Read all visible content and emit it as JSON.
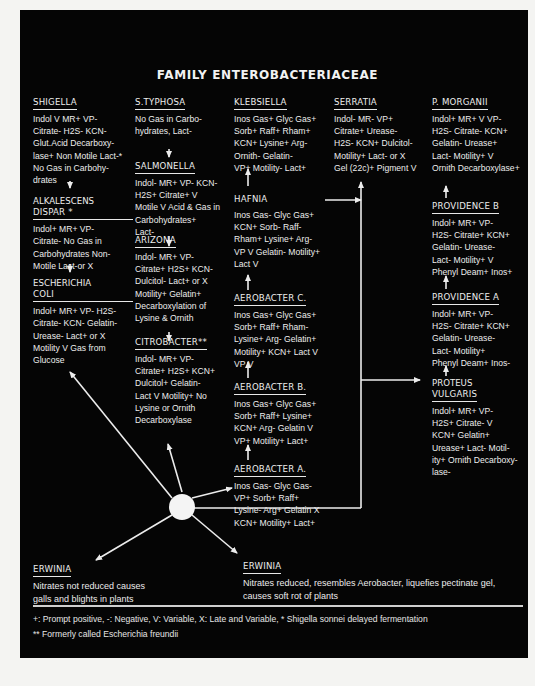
{
  "title": "FAMILY ENTEROBACTERIACEAE",
  "colors": {
    "background": "#050505",
    "text": "#ededed",
    "page": "#f4f4f2"
  },
  "blocks": {
    "shigella": {
      "name": "SHIGELLA",
      "lines": [
        "Indol V  MR+ VP-",
        "Citrate- H2S- KCN-",
        "Glut.Acid Decarboxy-",
        "lase+ Non Motile Lact-*",
        "No Gas in Carbohy-",
        "drates"
      ]
    },
    "alkalescens": {
      "name_1": "ALKALESCENS",
      "name_2": "DISPAR *",
      "lines": [
        "Indol+ MR+ VP-",
        "Citrate- No Gas in",
        "Carbohydrates Non-",
        "Motile Lact-or X"
      ]
    },
    "ecoli": {
      "name_1": "ESCHERICHIA",
      "name_2": "COLI",
      "lines": [
        "Indol+ MR+ VP- H2S-",
        "Citrate- KCN- Gelatin-",
        "Urease- Lact+ or X",
        "Motility V Gas from",
        "Glucose"
      ]
    },
    "typhosa": {
      "name": "S.TYPHOSA",
      "lines": [
        "No Gas in Carbo-",
        "hydrates, Lact-"
      ]
    },
    "salmonella": {
      "name": "SALMONELLA",
      "lines": [
        "Indol-  MR+ VP- KCN-",
        "H2S+ Citrate+ V",
        "Motile V Acid & Gas in",
        "Carbohydrates+",
        "Lact-"
      ]
    },
    "arizona": {
      "name": "ARIZONA",
      "lines": [
        "Indol- MR+ VP-",
        "Citrate+ H2S+ KCN-",
        "Dulcitol- Lact+ or X",
        "Motility+ Gelatin+",
        "Decarboxylation of",
        "Lysine & Ornith"
      ]
    },
    "citrobacter": {
      "name": "CITROBACTER**",
      "lines": [
        "Indol- MR+ VP-",
        "Citrate+ H2S+ KCN+",
        "Dulcitol+ Gelatin-",
        "Lact V Motility+ No",
        "Lysine or Ornith",
        "Decarboxylase"
      ]
    },
    "klebsiella": {
      "name": "KLEBSIELLA",
      "lines": [
        "Inos Gas+ Glyc Gas+",
        "Sorb+ Raff+ Rham+",
        "KCN+ Lysine+ Arg-",
        "Ornith- Gelatin-",
        "VP+ Motility- Lact+"
      ]
    },
    "hafnia": {
      "name": "HAFNIA",
      "lines": [
        "Inos Gas- Glyc Gas+",
        "KCN+ Sorb- Raff-",
        "Rham+ Lysine+ Arg-",
        "VP V Gelatin- Motility+",
        "Lact V"
      ]
    },
    "aerobacter_c": {
      "name": "AEROBACTER C.",
      "lines": [
        "Inos Gas+ Glyc Gas+",
        "Sorb+ Raff+ Rham-",
        "Lysine+ Arg- Gelatin+",
        "Motility+ KCN+ Lact V",
        "VP V"
      ]
    },
    "aerobacter_b": {
      "name": "AEROBACTER B.",
      "lines": [
        "Inos Gas+ Glyc Gas+",
        "Sorb+ Raff+ Lysine+",
        "KCN+ Arg- Gelatin V",
        "VP+ Motility+ Lact+"
      ]
    },
    "aerobacter_a": {
      "name": "AEROBACTER A.",
      "lines": [
        "Inos Gas- Glyc Gas-",
        "VP+ Sorb+ Raff+",
        "Lysine- Arg+ Gelatin X",
        "KCN+ Motility+ Lact+"
      ]
    },
    "serratia": {
      "name": "SERRATIA",
      "lines": [
        "Indol-  MR- VP+",
        "Citrate+ Urease-",
        "H2S- KCN+ Dulcitol-",
        "Motility+ Lact- or X",
        "Gel (22c)+ Pigment V"
      ]
    },
    "morganii": {
      "name": "P. MORGANII",
      "lines": [
        "Indol+  MR+ V VP-",
        "H2S- Citrate- KCN+",
        "Gelatin- Urease+",
        "Lact- Motility+ V",
        "Ornith Decarboxylase+"
      ]
    },
    "providence_b": {
      "name": "PROVIDENCE  B",
      "lines": [
        "Indol+ MR+ VP-",
        "H2S- Citrate+ KCN+",
        "Gelatin- Urease-",
        "Lact- Motility+ V",
        "Phenyl Deam+ Inos+"
      ]
    },
    "providence_a": {
      "name": "PROVIDENCE A",
      "lines": [
        "Indol+ MR+ VP-",
        "H2S- Citrate+ KCN+",
        "Gelatin- Urease-",
        "Lact- Motility+",
        "Phenyl Deam+ Inos-"
      ]
    },
    "proteus": {
      "name_1": "PROTEUS",
      "name_2": "VULGARIS",
      "lines": [
        "Indol+ MR+ VP-",
        "H2S+ Citrate- V",
        "KCN+ Gelatin+",
        "Urease+ Lact- Motil-",
        "ity+ Ornith Decarboxy-",
        "lase-"
      ]
    },
    "erwinia_left": {
      "name": "ERWINIA",
      "lines": [
        "Nitrates not reduced causes",
        "galls and blights in plants"
      ]
    },
    "erwinia_right": {
      "name": "ERWINIA",
      "lines": [
        "Nitrates reduced, resembles Aerobacter, liquefies pectinate gel,",
        "causes soft rot of plants"
      ]
    }
  },
  "legend": {
    "line_1": "+: Prompt positive,  -: Negative,  V: Variable,  X: Late and Variable,  * Shigella sonnei delayed fermentation",
    "line_2": "** Formerly called Escherichia freundii"
  }
}
